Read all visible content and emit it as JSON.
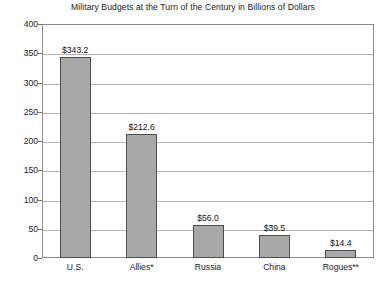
{
  "chart_data": {
    "type": "bar",
    "title": "Military Budgets at the Turn of the Century in Billions of Dollars",
    "xlabel": "",
    "ylabel": "",
    "categories": [
      "U.S.",
      "Allies*",
      "Russia",
      "China",
      "Rogues**"
    ],
    "values": [
      343.2,
      212.6,
      56.0,
      39.5,
      14.4
    ],
    "data_labels": [
      "$343.2",
      "$212.6",
      "$56.0",
      "$39.5",
      "$14.4"
    ],
    "ylim": [
      0,
      400
    ],
    "yticks": [
      0,
      50,
      100,
      150,
      200,
      250,
      300,
      350,
      400
    ],
    "ytick_labels": [
      "0",
      "50",
      "100",
      "150",
      "200",
      "250",
      "300",
      "350",
      "400"
    ],
    "grid": true,
    "legend": false,
    "bar_color": "#a8a8a8",
    "bar_edge_color": "#4d4d4d",
    "gridline_color": "#b4b4b4",
    "axis_color": "#8c8c8c",
    "text_color": "#1a1a1a"
  }
}
